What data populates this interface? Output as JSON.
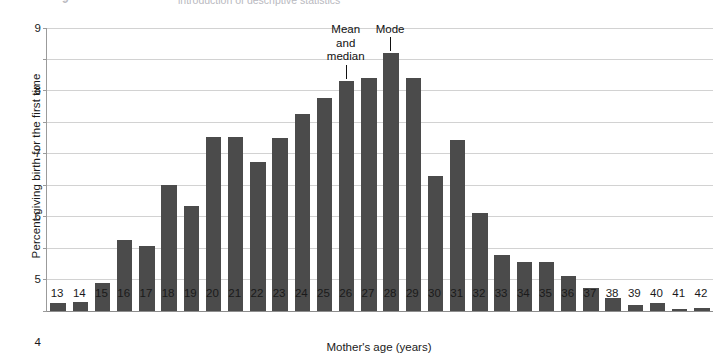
{
  "figure": {
    "top_caption_number": "9",
    "top_caption_text": "introduction of descriptive statistics"
  },
  "axes": {
    "y_title": "Percent giving birth for the first time",
    "x_title": "Mother's age (years)",
    "y_ticks": [
      "0",
      "1",
      "2",
      "3",
      "4",
      "5",
      "6",
      "7",
      "8",
      "9"
    ],
    "bar_color": "#4b4b4b",
    "gridline_color": "#d2d2d2"
  },
  "annotations": [
    {
      "name": "mean-and-median",
      "text": "Mean\nand\nmedian",
      "at_category": "26"
    },
    {
      "name": "mode",
      "text": "Mode",
      "at_category": "28"
    }
  ],
  "chart_data": {
    "type": "bar",
    "title": "",
    "xlabel": "Mother's age (years)",
    "ylabel": "Percent giving birth for the first time",
    "ylim": [
      0,
      9
    ],
    "ytick_step": 1,
    "grid": true,
    "legend": "none",
    "categories": [
      "13",
      "14",
      "15",
      "16",
      "17",
      "18",
      "19",
      "20",
      "21",
      "22",
      "23",
      "24",
      "25",
      "26",
      "27",
      "28",
      "29",
      "30",
      "31",
      "32",
      "33",
      "34",
      "35",
      "36",
      "37",
      "38",
      "39",
      "40",
      "41",
      "42"
    ],
    "values": [
      0.27,
      0.28,
      0.9,
      2.27,
      2.08,
      4.0,
      3.35,
      5.52,
      5.52,
      4.75,
      5.5,
      6.25,
      6.78,
      7.32,
      7.4,
      8.2,
      7.4,
      4.3,
      5.45,
      3.12,
      1.78,
      1.55,
      1.55,
      1.12,
      0.72,
      0.4,
      0.2,
      0.25,
      0.08,
      0.1
    ],
    "mean": 26,
    "median": 26,
    "mode": 28
  }
}
